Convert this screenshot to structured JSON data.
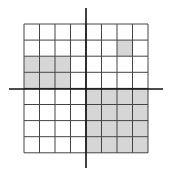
{
  "diagram": {
    "type": "coordinate-grid",
    "rows": 8,
    "cols": 8,
    "shaded_color": "#d6d6d6",
    "line_color": "#444444",
    "axis_color": "#111111",
    "shaded_cells": [
      [
        1,
        6
      ],
      [
        2,
        0
      ],
      [
        2,
        1
      ],
      [
        2,
        2
      ],
      [
        3,
        0
      ],
      [
        3,
        1
      ],
      [
        3,
        2
      ],
      [
        4,
        4
      ],
      [
        4,
        5
      ],
      [
        4,
        6
      ],
      [
        4,
        7
      ],
      [
        5,
        4
      ],
      [
        5,
        5
      ],
      [
        5,
        6
      ],
      [
        5,
        7
      ],
      [
        6,
        4
      ],
      [
        6,
        5
      ],
      [
        6,
        6
      ],
      [
        6,
        7
      ],
      [
        7,
        4
      ],
      [
        7,
        5
      ],
      [
        7,
        6
      ],
      [
        7,
        7
      ]
    ]
  }
}
